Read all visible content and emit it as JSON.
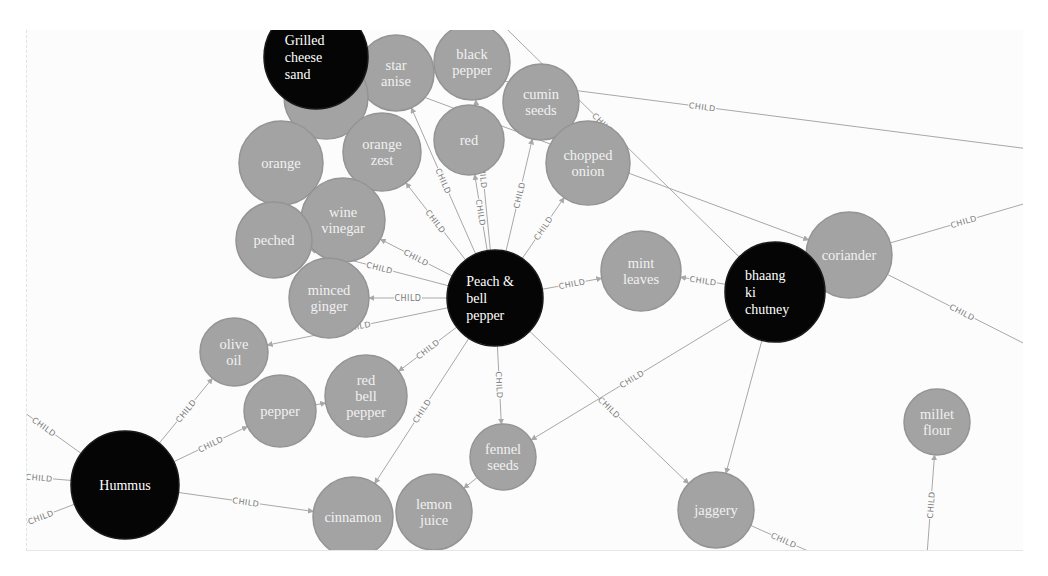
{
  "graph": {
    "relationship_label": "CHILD",
    "colors": {
      "dish_node": "#050505",
      "ingredient_node": "#a3a3a3",
      "edge": "#a8a8a8",
      "label_text_light": "#f1f1f1",
      "edge_label": "#7a7a7a"
    },
    "nodes": [
      {
        "id": "peach",
        "type": "dish",
        "lines": [
          "Peach &",
          "bell",
          "pepper"
        ],
        "x": 468,
        "y": 268,
        "r": 48
      },
      {
        "id": "bhaang",
        "type": "dish",
        "lines": [
          "bhaang",
          "ki",
          "chutney"
        ],
        "x": 748,
        "y": 262,
        "r": 50
      },
      {
        "id": "hummus",
        "type": "dish",
        "lines": [
          "Hummus"
        ],
        "x": 98,
        "y": 455,
        "r": 54
      },
      {
        "id": "grilled",
        "type": "dish",
        "lines": [
          "Grilled",
          "cheese",
          "sand"
        ],
        "x": 289,
        "y": 27,
        "r": 52
      },
      {
        "id": "star_anise",
        "type": "ingredient",
        "lines": [
          "star",
          "anise"
        ],
        "x": 369,
        "y": 43,
        "r": 38
      },
      {
        "id": "black_pepper",
        "type": "ingredient",
        "lines": [
          "black",
          "pepper"
        ],
        "x": 445,
        "y": 32,
        "r": 38
      },
      {
        "id": "dove",
        "type": "ingredient",
        "lines": [
          "dove"
        ],
        "x": 299,
        "y": 67,
        "r": 42
      },
      {
        "id": "cumin_seeds",
        "type": "ingredient",
        "lines": [
          "cumin",
          "seeds"
        ],
        "x": 514,
        "y": 72,
        "r": 38
      },
      {
        "id": "orange",
        "type": "ingredient",
        "lines": [
          "orange"
        ],
        "x": 254,
        "y": 133,
        "r": 42
      },
      {
        "id": "orange_zest",
        "type": "ingredient",
        "lines": [
          "orange",
          "zest"
        ],
        "x": 355,
        "y": 122,
        "r": 39
      },
      {
        "id": "red",
        "type": "ingredient",
        "lines": [
          "red"
        ],
        "x": 442,
        "y": 110,
        "r": 35
      },
      {
        "id": "chopped_onion",
        "type": "ingredient",
        "lines": [
          "chopped",
          "onion"
        ],
        "x": 561,
        "y": 133,
        "r": 42
      },
      {
        "id": "wine_vinegar",
        "type": "ingredient",
        "lines": [
          "wine",
          "vinegar"
        ],
        "x": 316,
        "y": 190,
        "r": 42
      },
      {
        "id": "peched",
        "type": "ingredient",
        "lines": [
          "peched"
        ],
        "x": 247,
        "y": 210,
        "r": 38
      },
      {
        "id": "minced_ginger",
        "type": "ingredient",
        "lines": [
          "minced",
          "ginger"
        ],
        "x": 302,
        "y": 268,
        "r": 40
      },
      {
        "id": "mint_leaves",
        "type": "ingredient",
        "lines": [
          "mint",
          "leaves"
        ],
        "x": 614,
        "y": 241,
        "r": 40
      },
      {
        "id": "coriander",
        "type": "ingredient",
        "lines": [
          "coriander"
        ],
        "x": 822,
        "y": 225,
        "r": 43
      },
      {
        "id": "olive_oil",
        "type": "ingredient",
        "lines": [
          "olive",
          "oil"
        ],
        "x": 207,
        "y": 322,
        "r": 34
      },
      {
        "id": "pepper",
        "type": "ingredient",
        "lines": [
          "pepper"
        ],
        "x": 253,
        "y": 381,
        "r": 36
      },
      {
        "id": "red_bell_pepper",
        "type": "ingredient",
        "lines": [
          "red",
          "bell",
          "pepper"
        ],
        "x": 339,
        "y": 366,
        "r": 41
      },
      {
        "id": "fennel_seeds",
        "type": "ingredient",
        "lines": [
          "fennel",
          "seeds"
        ],
        "x": 476,
        "y": 427,
        "r": 33
      },
      {
        "id": "cinnamon",
        "type": "ingredient",
        "lines": [
          "cinnamon"
        ],
        "x": 326,
        "y": 487,
        "r": 40
      },
      {
        "id": "lemon_juice",
        "type": "ingredient",
        "lines": [
          "lemon",
          "juice"
        ],
        "x": 407,
        "y": 482,
        "r": 38
      },
      {
        "id": "jaggery",
        "type": "ingredient",
        "lines": [
          "jaggery"
        ],
        "x": 689,
        "y": 480,
        "r": 38
      },
      {
        "id": "millet_flour",
        "type": "ingredient",
        "lines": [
          "millet",
          "flour"
        ],
        "x": 910,
        "y": 392,
        "r": 33
      }
    ],
    "edges": [
      {
        "from": "peach",
        "to": "star_anise",
        "label": "CHILD"
      },
      {
        "from": "peach",
        "to": "red",
        "label": "CHILD"
      },
      {
        "from": "peach",
        "to": "black_pepper",
        "label": "CHILD"
      },
      {
        "from": "peach",
        "to": "cumin_seeds",
        "label": "CHILD"
      },
      {
        "from": "peach",
        "to": "chopped_onion",
        "label": "CHILD"
      },
      {
        "from": "peach",
        "to": "orange_zest",
        "label": "CHILD"
      },
      {
        "from": "peach",
        "to": "wine_vinegar",
        "label": "CHILD"
      },
      {
        "from": "peach",
        "to": "peched",
        "label": "CHILD"
      },
      {
        "from": "peach",
        "to": "minced_ginger",
        "label": "CHILD"
      },
      {
        "from": "peach",
        "to": "olive_oil",
        "label": "CHILD"
      },
      {
        "from": "peach",
        "to": "red_bell_pepper",
        "label": "CHILD"
      },
      {
        "from": "peach",
        "to": "mint_leaves",
        "label": "CHILD"
      },
      {
        "from": "peach",
        "to": "fennel_seeds",
        "label": "CHILD"
      },
      {
        "from": "peach",
        "to": "cinnamon",
        "label": "CHILD"
      },
      {
        "from": "peach",
        "to": "jaggery",
        "label": "CHILD"
      },
      {
        "from": "bhaang",
        "to": "mint_leaves",
        "label": "CHILD"
      },
      {
        "from": "bhaang",
        "to": "fennel_seeds",
        "label": "CHILD"
      },
      {
        "from": "bhaang",
        "to": "jaggery",
        "label": ""
      },
      {
        "from": "bhaang",
        "to": "top_offscreen",
        "label": "CHILD"
      },
      {
        "from": "grilled",
        "to": "coriander",
        "label": "CHILD"
      },
      {
        "from": "grilled",
        "to": "right_offscreen",
        "label": "CHILD"
      },
      {
        "from": "coriander",
        "to": "right_offscreen_2",
        "label": "CHILD"
      },
      {
        "from": "coriander",
        "to": "right_offscreen_3",
        "label": "CHILD"
      },
      {
        "from": "hummus",
        "to": "olive_oil",
        "label": "CHILD"
      },
      {
        "from": "hummus",
        "to": "pepper",
        "label": "CHILD"
      },
      {
        "from": "hummus",
        "to": "cinnamon",
        "label": "CHILD"
      },
      {
        "from": "hummus",
        "to": "left_offscreen_1",
        "label": "CHILD"
      },
      {
        "from": "hummus",
        "to": "left_offscreen_2",
        "label": "CHILD"
      },
      {
        "from": "hummus",
        "to": "left_offscreen_3",
        "label": "CHILD"
      },
      {
        "from": "fennel_seeds",
        "to": "lemon_juice",
        "label": ""
      },
      {
        "from": "pepper",
        "to": "red_bell_pepper",
        "label": ""
      },
      {
        "from": "jaggery",
        "to": "bottom_offscreen",
        "label": "CHILD"
      },
      {
        "from": "bottom_offscreen_2",
        "to": "millet_flour",
        "label": "CHILD"
      }
    ]
  }
}
